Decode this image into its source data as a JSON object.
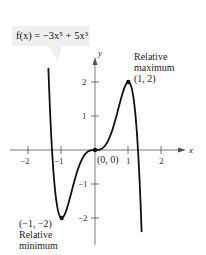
{
  "chart_data": {
    "type": "line",
    "title": "f(x) = −3x⁵ + 5x³",
    "function": "-3x^5 + 5x^3",
    "xlabel": "x",
    "ylabel": "y",
    "xlim": [
      -2.5,
      2.5
    ],
    "ylim": [
      -3,
      3
    ],
    "x_ticks": [
      -2,
      -1,
      1,
      2
    ],
    "y_ticks": [
      -2,
      -1,
      1,
      2
    ],
    "grid": false,
    "points": [
      {
        "x": -1,
        "y": -2,
        "label": "(−1, −2)",
        "note": "Relative minimum"
      },
      {
        "x": 0,
        "y": 0,
        "label": "(0, 0)"
      },
      {
        "x": 1,
        "y": 2,
        "label": "(1, 2)",
        "note": "Relative maximum"
      }
    ],
    "series": [
      {
        "name": "f(x)",
        "x": [
          -1.35,
          -1.29,
          -1.2,
          -1.1,
          -1,
          -0.8,
          -0.6,
          -0.4,
          -0.2,
          0,
          0.2,
          0.4,
          0.6,
          0.8,
          1,
          1.1,
          1.2,
          1.29,
          1.35
        ],
        "values": [
          1.7,
          0,
          -1.23,
          -1.89,
          -2,
          -1.58,
          -0.85,
          -0.29,
          -0.04,
          0,
          0.04,
          0.29,
          0.85,
          1.58,
          2,
          1.89,
          1.23,
          0,
          -1.7
        ]
      }
    ]
  },
  "labels": {
    "equation": "f(x) = −3x⁵ + 5x³",
    "y_axis": "y",
    "x_axis": "x",
    "max_text_1": "Relative",
    "max_text_2": "maximum",
    "max_point": "(1, 2)",
    "min_point": "(−1, −2)",
    "min_text_1": "Relative",
    "min_text_2": "minimum",
    "origin_point": "(0, 0)",
    "tick_x_neg2": "−2",
    "tick_x_neg1": "−1",
    "tick_x_1": "1",
    "tick_x_2": "2",
    "tick_y_2": "2",
    "tick_y_1": "1",
    "tick_y_neg1": "−1",
    "tick_y_neg2": "−2"
  }
}
